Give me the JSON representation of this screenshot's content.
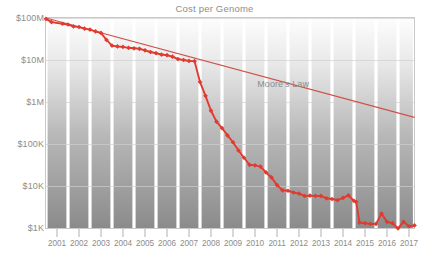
{
  "chart_data": {
    "type": "line",
    "title": "Cost per Genome",
    "xlabel": "",
    "ylabel": "",
    "grid": true,
    "legend_position": "inline-annotation",
    "y_scale": "log",
    "ylim": [
      1000,
      100000000
    ],
    "y_ticks": [
      {
        "value": 100000000,
        "label": "$100M"
      },
      {
        "value": 10000000,
        "label": "$10M"
      },
      {
        "value": 1000000,
        "label": "$1M"
      },
      {
        "value": 100000,
        "label": "$100K"
      },
      {
        "value": 10000,
        "label": "$10K"
      },
      {
        "value": 1000,
        "label": "$1K"
      }
    ],
    "x_ticks": [
      "2001",
      "2002",
      "2003",
      "2004",
      "2005",
      "2006",
      "2007",
      "2008",
      "2009",
      "2010",
      "2011",
      "2012",
      "2013",
      "2014",
      "2015",
      "2016",
      "2017"
    ],
    "xlim": [
      2001,
      2017.75
    ],
    "annotations": [
      {
        "text": "Moore's Law",
        "x": 2010.6,
        "y": 2600000
      }
    ],
    "series": [
      {
        "name": "Cost per Genome",
        "color": "#e03b30",
        "marker": "diamond",
        "points": [
          {
            "x": 2001.0,
            "y": 95000000
          },
          {
            "x": 2001.25,
            "y": 80000000
          },
          {
            "x": 2001.75,
            "y": 73000000
          },
          {
            "x": 2002.0,
            "y": 70000000
          },
          {
            "x": 2002.25,
            "y": 63000000
          },
          {
            "x": 2002.5,
            "y": 61000000
          },
          {
            "x": 2002.75,
            "y": 56000000
          },
          {
            "x": 2003.0,
            "y": 53000000
          },
          {
            "x": 2003.25,
            "y": 48000000
          },
          {
            "x": 2003.5,
            "y": 44000000
          },
          {
            "x": 2003.75,
            "y": 30000000
          },
          {
            "x": 2004.0,
            "y": 22000000
          },
          {
            "x": 2004.25,
            "y": 21000000
          },
          {
            "x": 2004.5,
            "y": 20500000
          },
          {
            "x": 2004.75,
            "y": 19500000
          },
          {
            "x": 2005.0,
            "y": 19000000
          },
          {
            "x": 2005.25,
            "y": 18500000
          },
          {
            "x": 2005.5,
            "y": 17000000
          },
          {
            "x": 2005.75,
            "y": 15500000
          },
          {
            "x": 2006.0,
            "y": 14500000
          },
          {
            "x": 2006.25,
            "y": 13500000
          },
          {
            "x": 2006.5,
            "y": 13000000
          },
          {
            "x": 2006.75,
            "y": 12000000
          },
          {
            "x": 2007.0,
            "y": 10500000
          },
          {
            "x": 2007.25,
            "y": 10000000
          },
          {
            "x": 2007.5,
            "y": 9500000
          },
          {
            "x": 2007.75,
            "y": 9400000
          },
          {
            "x": 2008.0,
            "y": 3000000
          },
          {
            "x": 2008.25,
            "y": 1400000
          },
          {
            "x": 2008.5,
            "y": 620000
          },
          {
            "x": 2008.75,
            "y": 340000
          },
          {
            "x": 2009.0,
            "y": 240000
          },
          {
            "x": 2009.25,
            "y": 160000
          },
          {
            "x": 2009.5,
            "y": 110000
          },
          {
            "x": 2009.75,
            "y": 70000
          },
          {
            "x": 2010.0,
            "y": 47000
          },
          {
            "x": 2010.25,
            "y": 32000
          },
          {
            "x": 2010.5,
            "y": 31000
          },
          {
            "x": 2010.75,
            "y": 29000
          },
          {
            "x": 2011.0,
            "y": 21000
          },
          {
            "x": 2011.25,
            "y": 16000
          },
          {
            "x": 2011.5,
            "y": 10500
          },
          {
            "x": 2011.75,
            "y": 7900
          },
          {
            "x": 2012.0,
            "y": 7700
          },
          {
            "x": 2012.25,
            "y": 7000
          },
          {
            "x": 2012.5,
            "y": 6600
          },
          {
            "x": 2012.75,
            "y": 5800
          },
          {
            "x": 2013.0,
            "y": 5900
          },
          {
            "x": 2013.25,
            "y": 5800
          },
          {
            "x": 2013.5,
            "y": 5800
          },
          {
            "x": 2013.75,
            "y": 5100
          },
          {
            "x": 2014.0,
            "y": 4900
          },
          {
            "x": 2014.25,
            "y": 4600
          },
          {
            "x": 2014.5,
            "y": 5200
          },
          {
            "x": 2014.75,
            "y": 6000
          },
          {
            "x": 2015.0,
            "y": 4400
          },
          {
            "x": 2015.1,
            "y": 4200
          },
          {
            "x": 2015.25,
            "y": 1350
          },
          {
            "x": 2015.5,
            "y": 1300
          },
          {
            "x": 2015.75,
            "y": 1250
          },
          {
            "x": 2016.0,
            "y": 1250
          },
          {
            "x": 2016.25,
            "y": 2200
          },
          {
            "x": 2016.5,
            "y": 1400
          },
          {
            "x": 2016.75,
            "y": 1300
          },
          {
            "x": 2017.0,
            "y": 980
          },
          {
            "x": 2017.25,
            "y": 1400
          },
          {
            "x": 2017.5,
            "y": 1100
          },
          {
            "x": 2017.75,
            "y": 1150
          }
        ]
      },
      {
        "name": "Moore's Law",
        "color": "#d05048",
        "marker": "none",
        "points": [
          {
            "x": 2001.0,
            "y": 100000000
          },
          {
            "x": 2017.75,
            "y": 430000
          }
        ]
      }
    ]
  },
  "colors": {
    "data_line": "#e03b30",
    "moores_law_line": "#d05048",
    "text": "#8d8d8d",
    "grid": "#cfcfcf",
    "frame": "#c8c8c8",
    "band_top": "#fcfcfc",
    "band_bottom": "#8e8e8e",
    "background": "#ffffff"
  }
}
